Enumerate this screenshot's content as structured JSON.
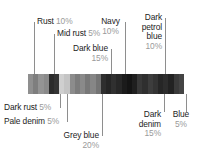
{
  "figure": {
    "type": "color-proportion-bar"
  },
  "chart_data": {
    "type": "bar",
    "title": "",
    "xlabel": "",
    "ylabel": "",
    "orientation": "horizontal-stacked",
    "categories": [
      "Rust",
      "Mid rust",
      "Dark rust",
      "Pale denim",
      "Grey blue",
      "Dark blue",
      "Navy",
      "Dark denim",
      "Dark petrol blue",
      "Blue"
    ],
    "values": [
      10,
      5,
      5,
      5,
      20,
      15,
      10,
      15,
      10,
      5
    ],
    "value_labels": [
      "10%",
      "5%",
      "5%",
      "5%",
      "20%",
      "15%",
      "10%",
      "15%",
      "10%",
      "5%"
    ],
    "units": "%",
    "total": 100,
    "grid": false,
    "legend": "callout-labels"
  },
  "bar": {
    "segments": [
      {
        "name": "rust",
        "color": "#8f8f8f"
      },
      {
        "name": "rust",
        "color": "#7e7e7e"
      },
      {
        "name": "mid-rust",
        "color": "#949494"
      },
      {
        "name": "mid-rust",
        "color": "#8a8a8a"
      },
      {
        "name": "dark-rust",
        "color": "#2b2b2b"
      },
      {
        "name": "dark-rust",
        "color": "#343434"
      },
      {
        "name": "pale-denim",
        "color": "#cfcfcf"
      },
      {
        "name": "pale-denim",
        "color": "#c4c4c4"
      },
      {
        "name": "grey-blue",
        "color": "#8c8c8c"
      },
      {
        "name": "grey-blue",
        "color": "#7c7c7c"
      },
      {
        "name": "grey-blue",
        "color": "#8a8a8a"
      },
      {
        "name": "grey-blue",
        "color": "#787878"
      },
      {
        "name": "grey-blue",
        "color": "#868686"
      },
      {
        "name": "grey-blue",
        "color": "#747474"
      },
      {
        "name": "dark-blue",
        "color": "#2e2e2e"
      },
      {
        "name": "dark-blue",
        "color": "#252525"
      },
      {
        "name": "dark-blue",
        "color": "#303030"
      },
      {
        "name": "dark-blue",
        "color": "#272727"
      },
      {
        "name": "navy",
        "color": "#1b1b1b"
      },
      {
        "name": "navy",
        "color": "#141414"
      },
      {
        "name": "navy",
        "color": "#1f1f1f"
      },
      {
        "name": "dark-denim",
        "color": "#383838"
      },
      {
        "name": "dark-denim",
        "color": "#2f2f2f"
      },
      {
        "name": "dark-denim",
        "color": "#3d3d3d"
      },
      {
        "name": "dark-denim",
        "color": "#343434"
      },
      {
        "name": "dark-petrol-blue",
        "color": "#262626"
      },
      {
        "name": "dark-petrol-blue",
        "color": "#2d2d2d"
      },
      {
        "name": "dark-petrol-blue",
        "color": "#222222"
      },
      {
        "name": "blue",
        "color": "#3a3a3a"
      },
      {
        "name": "blue",
        "color": "#444444"
      }
    ]
  },
  "callouts": {
    "rust": {
      "name": "Rust",
      "pct": "10%"
    },
    "mid_rust": {
      "name": "Mid rust",
      "pct": "5%"
    },
    "dark_blue": {
      "name": "Dark blue",
      "pct": "15%"
    },
    "navy": {
      "name": "Navy",
      "pct": "10%"
    },
    "dark_petrol_blue": {
      "name": "Dark petrol blue",
      "pct": "10%",
      "line1": "Dark",
      "line2": "petrol",
      "line3": "blue"
    },
    "dark_rust": {
      "name": "Dark rust",
      "pct": "5%"
    },
    "pale_denim": {
      "name": "Pale denim",
      "pct": "5%"
    },
    "grey_blue": {
      "name": "Grey blue",
      "pct": "20%"
    },
    "dark_denim": {
      "name": "Dark denim",
      "pct": "15%",
      "line1": "Dark",
      "line2": "denim"
    },
    "blue": {
      "name": "Blue",
      "pct": "5%"
    }
  },
  "colors": {
    "text": "#1c1c1c",
    "muted": "#9a9a9a",
    "leader": "#8e8e8e",
    "background": "#ffffff"
  }
}
